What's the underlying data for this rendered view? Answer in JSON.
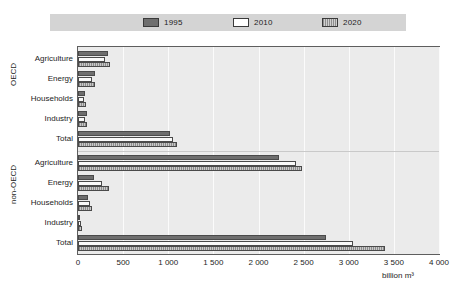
{
  "legend": {
    "entries": [
      {
        "label": "1995",
        "key": "1995",
        "color": "#6e6e6e"
      },
      {
        "label": "2010",
        "key": "2010",
        "color": "#ffffff"
      },
      {
        "label": "2020",
        "key": "2020",
        "color": "#b0b0b0"
      }
    ]
  },
  "axis": {
    "unit": "billion m³",
    "ticks": [
      "0",
      "500",
      "1 000",
      "1 500",
      "2 000",
      "2 500",
      "3 000",
      "3 500",
      "4 000"
    ]
  },
  "groups": [
    {
      "name": "OECD"
    },
    {
      "name": "non-OECD"
    }
  ],
  "categories": [
    "Agriculture",
    "Energy",
    "Households",
    "Industry",
    "Total"
  ],
  "chart_data": {
    "type": "bar",
    "orientation": "horizontal",
    "title": "",
    "xlabel": "billion m³",
    "ylabel": "",
    "xlim": [
      0,
      4000
    ],
    "xticks": [
      0,
      500,
      1000,
      1500,
      2000,
      2500,
      3000,
      3500,
      4000
    ],
    "grid": true,
    "legend_position": "top",
    "group_labels": [
      "OECD",
      "non-OECD"
    ],
    "categories": [
      "Agriculture",
      "Energy",
      "Households",
      "Industry",
      "Total"
    ],
    "series": [
      {
        "name": "1995",
        "color": "#6e6e6e",
        "OECD": [
          330,
          190,
          75,
          100,
          1020
        ],
        "non-OECD": [
          2230,
          180,
          110,
          25,
          2750
        ]
      },
      {
        "name": "2010",
        "color": "#ffffff",
        "OECD": [
          300,
          160,
          65,
          75,
          1050
        ],
        "non-OECD": [
          2410,
          270,
          130,
          30,
          3050
        ]
      },
      {
        "name": "2020",
        "color": "#b0b0b0",
        "OECD": [
          355,
          190,
          85,
          95,
          1100
        ],
        "non-OECD": [
          2480,
          340,
          160,
          40,
          3400
        ]
      }
    ]
  }
}
